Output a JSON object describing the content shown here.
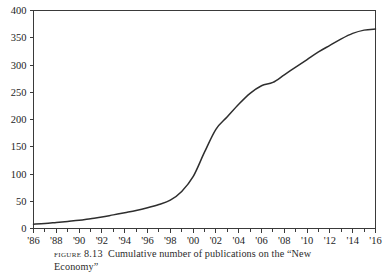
{
  "figure": {
    "caption_tag": "Figure",
    "caption_number": "8.13",
    "caption_line1": "Cumulative number of publications on the “New",
    "caption_line2": "Economy”"
  },
  "chart_data": {
    "type": "line",
    "title": "",
    "xlabel": "",
    "ylabel": "",
    "xlim": [
      1986,
      2016
    ],
    "ylim": [
      0,
      400
    ],
    "grid": false,
    "legend": null,
    "y_ticks": [
      0,
      50,
      100,
      150,
      200,
      250,
      300,
      350,
      400
    ],
    "y_tick_labels": [
      "0",
      "50",
      "100",
      "150",
      "200",
      "250",
      "300",
      "350",
      "400"
    ],
    "x_ticks": [
      1986,
      1988,
      1990,
      1992,
      1994,
      1996,
      1998,
      2000,
      2002,
      2004,
      2006,
      2008,
      2010,
      2012,
      2014,
      2016
    ],
    "x_tick_labels": [
      "'86",
      "'88",
      "'90",
      "'92",
      "'94",
      "'96",
      "'98",
      "'00",
      "'02",
      "'04",
      "'06",
      "'08",
      "'10",
      "'12",
      "'14",
      "'16"
    ],
    "x_minor_tick_step": 1,
    "series": [
      {
        "name": "Cumulative publications",
        "color": "#2e2e2e",
        "x": [
          1986,
          1987,
          1988,
          1989,
          1990,
          1991,
          1992,
          1993,
          1994,
          1995,
          1996,
          1997,
          1998,
          1999,
          2000,
          2001,
          2002,
          2003,
          2004,
          2005,
          2006,
          2007,
          2008,
          2009,
          2010,
          2011,
          2012,
          2013,
          2014,
          2015,
          2016
        ],
        "values": [
          8,
          9,
          11,
          13,
          15,
          18,
          21,
          25,
          29,
          33,
          38,
          44,
          52,
          68,
          95,
          140,
          182,
          205,
          228,
          248,
          262,
          268,
          282,
          296,
          310,
          324,
          336,
          348,
          358,
          364,
          366
        ]
      }
    ]
  }
}
